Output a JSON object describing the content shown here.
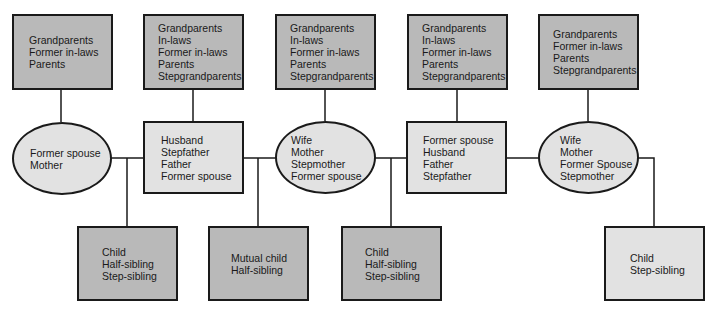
{
  "diagram": {
    "colors": {
      "line": "#1a1a1a",
      "dark_fill": "#b9b9b9",
      "light_fill": "#e2e2e2"
    },
    "top_boxes": [
      {
        "lines": [
          "Grandparents",
          "Former in-laws",
          "Parents"
        ]
      },
      {
        "lines": [
          "Grandparents",
          "In-laws",
          "Former in-laws",
          "Parents",
          "Stepgrandparents"
        ]
      },
      {
        "lines": [
          "Grandparents",
          "In-laws",
          "Former in-laws",
          "Parents",
          "Stepgrandparents"
        ]
      },
      {
        "lines": [
          "Grandparents",
          "In-laws",
          "Former in-laws",
          "Parents",
          "Stepgrandparents"
        ]
      },
      {
        "lines": [
          "Grandparents",
          "Former in-laws",
          "Parents",
          "Stepgrandparents"
        ]
      }
    ],
    "spouses": [
      {
        "shape": "oval",
        "lines": [
          "Former spouse",
          "Mother"
        ]
      },
      {
        "shape": "box",
        "lines": [
          "Husband",
          "Stepfather",
          "Father",
          "Former spouse"
        ]
      },
      {
        "shape": "oval",
        "lines": [
          "Wife",
          "Mother",
          "Stepmother",
          "Former spouse"
        ]
      },
      {
        "shape": "box",
        "lines": [
          "Former spouse",
          "Husband",
          "Father",
          "Stepfather"
        ]
      },
      {
        "shape": "oval",
        "lines": [
          "Wife",
          "Mother",
          "Former Spouse",
          "Stepmother"
        ]
      }
    ],
    "children": [
      {
        "lines": [
          "Child",
          "Half-sibling",
          "Step-sibling"
        ]
      },
      {
        "lines": [
          "Mutual child",
          "Half-sibling"
        ]
      },
      {
        "lines": [
          "Child",
          "Half-sibling",
          "Step-sibling"
        ]
      },
      {
        "lines": [
          "Child",
          "Step-sibling"
        ]
      }
    ]
  }
}
